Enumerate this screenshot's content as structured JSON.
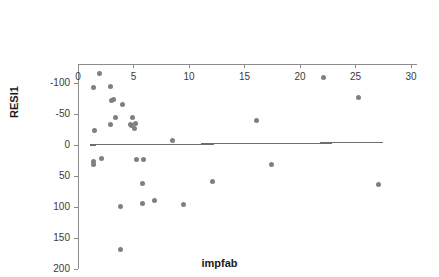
{
  "chart_data": {
    "type": "scatter",
    "title": "",
    "subtitle": "",
    "xlabel": "impfab",
    "ylabel": "RESI1",
    "xlim": [
      0,
      30
    ],
    "ylim": [
      -130,
      200
    ],
    "grid": false,
    "legend": null,
    "legend_position": "none",
    "xticks": [
      0,
      5,
      10,
      15,
      20,
      25,
      30
    ],
    "xticklabels": [
      "0",
      "5",
      "10",
      "15",
      "20",
      "25",
      "30"
    ],
    "yticks": [
      -100,
      -50,
      0,
      50,
      100,
      150,
      200
    ],
    "yticklabels": [
      "-100",
      "-50",
      "0",
      "50",
      "100",
      "150",
      "200"
    ],
    "point_color": "#808080",
    "line_color": "#6e6e6e",
    "axis_color": "#8c8c8c",
    "series": [
      {
        "name": "RESI1",
        "x": [
          1.4,
          1.4,
          1.5,
          1.4,
          1.9,
          2.1,
          2.9,
          2.9,
          3.0,
          3.2,
          3.4,
          3.8,
          3.8,
          4.0,
          4.7,
          4.8,
          4.9,
          5.1,
          5.2,
          5.3,
          5.8,
          5.8,
          5.9,
          6.9,
          8.5,
          9.5,
          12.1,
          16.1,
          17.4,
          22.1,
          25.3,
          27.1
        ],
        "y": [
          31,
          26,
          -23,
          -92,
          -115,
          21,
          -33,
          -94,
          -72,
          -74,
          -45,
          168,
          99,
          -65,
          -33,
          -31,
          -44,
          -26,
          -34,
          24,
          95,
          62,
          24,
          90,
          -8,
          96,
          59,
          -40,
          31,
          -109,
          -76,
          64
        ]
      }
    ],
    "trendline": {
      "name": "fit-line",
      "x0": 1.1,
      "y0": 0,
      "x1": 27.5,
      "y1": -4
    }
  },
  "axes": {
    "x_title": "impfab",
    "y_title": "RESI1"
  }
}
